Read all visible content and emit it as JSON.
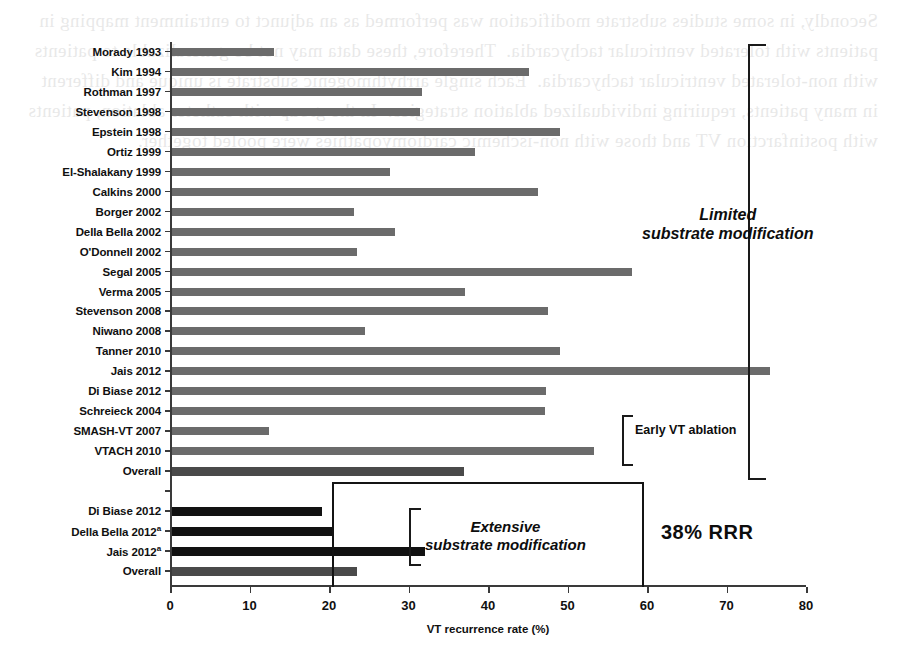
{
  "chart_data": {
    "type": "bar",
    "orientation": "horizontal",
    "title": "",
    "subtitle": "",
    "xlabel": "VT recurrence rate (%)",
    "ylabel": "",
    "xlim": [
      0,
      80
    ],
    "xticks": [
      0,
      10,
      20,
      30,
      40,
      50,
      60,
      70,
      80
    ],
    "xticklabels": [
      "0",
      "10",
      "20",
      "30",
      "40",
      "50",
      "60",
      "70",
      "80"
    ],
    "grid": false,
    "legend": null,
    "categories": [
      "Morady 1993",
      "Kim 1994",
      "Rothman 1997",
      "Stevenson 1998",
      "Epstein 1998",
      "Ortiz 1999",
      "El-Shalakany 1999",
      "Calkins 2000",
      "Borger 2002",
      "Della Bella 2002",
      "O'Donnell 2002",
      "Segal 2005",
      "Verma 2005",
      "Stevenson 2008",
      "Niwano 2008",
      "Tanner 2010",
      "Jais 2012",
      "Di Biase 2012",
      "Schreieck 2004",
      "SMASH-VT 2007",
      "VTACH 2010",
      "Overall",
      "",
      "Di Biase 2012",
      "Della Bella 2012",
      "Jais 2012",
      "Overall"
    ],
    "values": [
      12.8,
      44.9,
      31.4,
      31.2,
      48.8,
      38.1,
      27.4,
      46.1,
      22.9,
      28.1,
      23.3,
      57.9,
      36.9,
      47.3,
      24.3,
      48.8,
      75.2,
      47.1,
      46.9,
      12.2,
      53.1,
      36.7,
      null,
      18.9,
      20.1,
      31.8,
      23.3
    ],
    "rows": [
      {
        "label": "Morady 1993",
        "value": 12.8,
        "style": "gray",
        "footnote": ""
      },
      {
        "label": "Kim 1994",
        "value": 44.9,
        "style": "gray",
        "footnote": ""
      },
      {
        "label": "Rothman 1997",
        "value": 31.4,
        "style": "gray",
        "footnote": ""
      },
      {
        "label": "Stevenson 1998",
        "value": 31.2,
        "style": "gray",
        "footnote": ""
      },
      {
        "label": "Epstein 1998",
        "value": 48.8,
        "style": "gray",
        "footnote": ""
      },
      {
        "label": "Ortiz 1999",
        "value": 38.1,
        "style": "gray",
        "footnote": ""
      },
      {
        "label": "El-Shalakany 1999",
        "value": 27.4,
        "style": "gray",
        "footnote": ""
      },
      {
        "label": "Calkins 2000",
        "value": 46.1,
        "style": "gray",
        "footnote": ""
      },
      {
        "label": "Borger 2002",
        "value": 22.9,
        "style": "gray",
        "footnote": ""
      },
      {
        "label": "Della Bella 2002",
        "value": 28.1,
        "style": "gray",
        "footnote": ""
      },
      {
        "label": "O'Donnell 2002",
        "value": 23.3,
        "style": "gray",
        "footnote": ""
      },
      {
        "label": "Segal 2005",
        "value": 57.9,
        "style": "gray",
        "footnote": ""
      },
      {
        "label": "Verma 2005",
        "value": 36.9,
        "style": "gray",
        "footnote": ""
      },
      {
        "label": "Stevenson 2008",
        "value": 47.3,
        "style": "gray",
        "footnote": ""
      },
      {
        "label": "Niwano 2008",
        "value": 24.3,
        "style": "gray",
        "footnote": ""
      },
      {
        "label": "Tanner 2010",
        "value": 48.8,
        "style": "gray",
        "footnote": ""
      },
      {
        "label": "Jais 2012",
        "value": 75.2,
        "style": "gray",
        "footnote": ""
      },
      {
        "label": "Di Biase 2012",
        "value": 47.1,
        "style": "gray",
        "footnote": ""
      },
      {
        "label": "Schreieck 2004",
        "value": 46.9,
        "style": "gray",
        "footnote": ""
      },
      {
        "label": "SMASH-VT 2007",
        "value": 12.2,
        "style": "gray",
        "footnote": ""
      },
      {
        "label": "VTACH 2010",
        "value": 53.1,
        "style": "gray",
        "footnote": ""
      },
      {
        "label": "Overall",
        "value": 36.7,
        "style": "summary",
        "footnote": ""
      },
      {
        "label": "",
        "value": null,
        "style": "spacer",
        "footnote": ""
      },
      {
        "label": "Di Biase 2012",
        "value": 18.9,
        "style": "dark",
        "footnote": ""
      },
      {
        "label": "Della Bella 2012",
        "value": 20.1,
        "style": "dark",
        "footnote": "a"
      },
      {
        "label": "Jais 2012",
        "value": 31.8,
        "style": "dark",
        "footnote": "a"
      },
      {
        "label": "Overall",
        "value": 23.3,
        "style": "summary",
        "footnote": ""
      }
    ],
    "annotations": [
      {
        "id": "limited",
        "text": "Limited\nsubstrate modification",
        "style": "bold-italic"
      },
      {
        "id": "early",
        "text": "Early VT ablation",
        "style": "bold"
      },
      {
        "id": "extensive",
        "text": "Extensive\nsubstrate modification",
        "style": "bold-italic"
      },
      {
        "id": "rrr",
        "text": "38% RRR",
        "style": "bold"
      }
    ],
    "colors": {
      "bar_gray": "#6b6b6b",
      "bar_dark": "#111111",
      "bar_summary": "#4a4a4a",
      "axis": "#3a3a3a",
      "text": "#101010",
      "background": "#ffffff"
    }
  },
  "annotations": {
    "limited_line1": "Limited",
    "limited_line2": "substrate modification",
    "early_vt": "Early VT ablation",
    "extensive_line1": "Extensive",
    "extensive_line2": "substrate modification",
    "rrr": "38% RRR"
  },
  "axis": {
    "x_title": "VT recurrence rate (%)",
    "x_ticks": [
      "0",
      "10",
      "20",
      "30",
      "40",
      "50",
      "60",
      "70",
      "80"
    ]
  },
  "bleed_text": "Secondly, in some studies substrate modification was performed as an adjunct to entrainment mapping in patients with tolerated ventricular tachycardia.  Therefore, these data may not be generalizable to patients with non-tolerated ventricular tachycardia.  Each single arrhythmogenic substrate is unique and different in many patients, requiring individualized ablation strategies.  In the group with catheter ablation, patients with postinfarction VT and those with non-ischemic cardiomyopathies were pooled together."
}
